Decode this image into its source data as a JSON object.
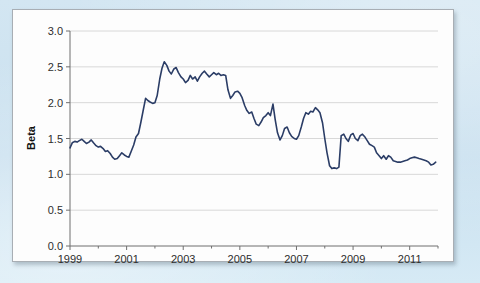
{
  "page": {
    "background_color": "#d0e5f1",
    "panel_background": "#fdfdfd",
    "panel_border_color": "#a8aeb4"
  },
  "chart_data": {
    "type": "line",
    "title": "",
    "subtitle": "",
    "xlabel": "",
    "ylabel": "Beta",
    "ylim": [
      0.0,
      3.0
    ],
    "xlim": [
      1999.0,
      2012.0
    ],
    "grid": true,
    "grid_axis": "y",
    "grid_color": "#d8d8d8",
    "legend": false,
    "legend_position": "none",
    "line_color": "#2b3d66",
    "line_width": 1.6,
    "y_ticks": [
      "0.0",
      "0.5",
      "1.0",
      "1.5",
      "2.0",
      "2.5",
      "3.0"
    ],
    "y_tick_values": [
      0.0,
      0.5,
      1.0,
      1.5,
      2.0,
      2.5,
      3.0
    ],
    "x_ticks": [
      "1999",
      "2001",
      "2003",
      "2005",
      "2007",
      "2009",
      "2011"
    ],
    "x_tick_values": [
      1999,
      2001,
      2003,
      2005,
      2007,
      2009,
      2011
    ],
    "x_minor_tick_values": [
      2000,
      2002,
      2004,
      2006,
      2008,
      2010,
      2012
    ],
    "series": [
      {
        "name": "Beta",
        "x": [
          1999.0,
          1999.08,
          1999.17,
          1999.25,
          1999.33,
          1999.42,
          1999.5,
          1999.58,
          1999.67,
          1999.75,
          1999.83,
          1999.92,
          2000.0,
          2000.08,
          2000.17,
          2000.25,
          2000.33,
          2000.42,
          2000.5,
          2000.58,
          2000.67,
          2000.75,
          2000.83,
          2000.92,
          2001.0,
          2001.08,
          2001.17,
          2001.25,
          2001.33,
          2001.42,
          2001.5,
          2001.58,
          2001.67,
          2001.75,
          2001.83,
          2001.92,
          2002.0,
          2002.08,
          2002.17,
          2002.25,
          2002.33,
          2002.42,
          2002.5,
          2002.58,
          2002.67,
          2002.75,
          2002.83,
          2002.92,
          2003.0,
          2003.08,
          2003.17,
          2003.25,
          2003.33,
          2003.42,
          2003.5,
          2003.58,
          2003.67,
          2003.75,
          2003.83,
          2003.92,
          2004.0,
          2004.08,
          2004.17,
          2004.25,
          2004.33,
          2004.42,
          2004.5,
          2004.58,
          2004.67,
          2004.75,
          2004.83,
          2004.92,
          2005.0,
          2005.08,
          2005.17,
          2005.25,
          2005.33,
          2005.42,
          2005.5,
          2005.58,
          2005.67,
          2005.75,
          2005.83,
          2005.92,
          2006.0,
          2006.08,
          2006.17,
          2006.25,
          2006.33,
          2006.42,
          2006.5,
          2006.58,
          2006.67,
          2006.75,
          2006.83,
          2006.92,
          2007.0,
          2007.08,
          2007.17,
          2007.25,
          2007.33,
          2007.42,
          2007.5,
          2007.58,
          2007.67,
          2007.75,
          2007.83,
          2007.92,
          2008.0,
          2008.08,
          2008.17,
          2008.25,
          2008.33,
          2008.42,
          2008.5,
          2008.58,
          2008.67,
          2008.75,
          2008.83,
          2008.92,
          2009.0,
          2009.08,
          2009.17,
          2009.25,
          2009.33,
          2009.42,
          2009.5,
          2009.58,
          2009.67,
          2009.75,
          2009.83,
          2009.92,
          2010.0,
          2010.08,
          2010.17,
          2010.25,
          2010.33,
          2010.42,
          2010.5,
          2010.58,
          2010.67,
          2010.75,
          2010.83,
          2010.92,
          2011.0,
          2011.08,
          2011.17,
          2011.25,
          2011.33,
          2011.42,
          2011.5,
          2011.58,
          2011.67,
          2011.75,
          2011.83,
          2011.92
        ],
        "values": [
          1.37,
          1.44,
          1.46,
          1.45,
          1.47,
          1.49,
          1.46,
          1.43,
          1.45,
          1.48,
          1.44,
          1.4,
          1.38,
          1.39,
          1.36,
          1.32,
          1.33,
          1.29,
          1.24,
          1.21,
          1.22,
          1.26,
          1.3,
          1.27,
          1.25,
          1.24,
          1.33,
          1.41,
          1.52,
          1.57,
          1.72,
          1.88,
          2.06,
          2.03,
          2.01,
          1.99,
          2.0,
          2.1,
          2.33,
          2.48,
          2.57,
          2.52,
          2.44,
          2.4,
          2.47,
          2.49,
          2.42,
          2.36,
          2.33,
          2.28,
          2.31,
          2.38,
          2.33,
          2.36,
          2.3,
          2.36,
          2.41,
          2.44,
          2.4,
          2.36,
          2.39,
          2.42,
          2.39,
          2.41,
          2.38,
          2.39,
          2.38,
          2.18,
          2.06,
          2.1,
          2.15,
          2.16,
          2.13,
          2.07,
          1.96,
          1.89,
          1.85,
          1.87,
          1.78,
          1.7,
          1.68,
          1.73,
          1.79,
          1.82,
          1.86,
          1.82,
          1.98,
          1.76,
          1.58,
          1.48,
          1.54,
          1.64,
          1.66,
          1.58,
          1.53,
          1.5,
          1.49,
          1.54,
          1.66,
          1.78,
          1.86,
          1.84,
          1.88,
          1.87,
          1.93,
          1.9,
          1.86,
          1.72,
          1.5,
          1.3,
          1.12,
          1.08,
          1.09,
          1.08,
          1.1,
          1.54,
          1.56,
          1.5,
          1.46,
          1.55,
          1.57,
          1.5,
          1.47,
          1.54,
          1.56,
          1.52,
          1.47,
          1.42,
          1.4,
          1.38,
          1.3,
          1.26,
          1.22,
          1.26,
          1.21,
          1.26,
          1.24,
          1.19,
          1.18,
          1.17,
          1.17,
          1.18,
          1.19,
          1.2,
          1.22,
          1.23,
          1.24,
          1.23,
          1.22,
          1.21,
          1.2,
          1.19,
          1.17,
          1.13,
          1.14,
          1.17
        ]
      }
    ]
  }
}
